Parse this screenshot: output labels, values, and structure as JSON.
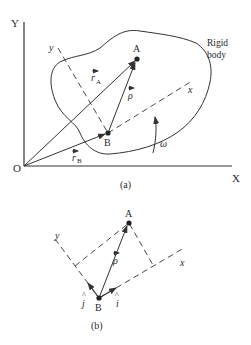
{
  "figure_a": {
    "axis_y_label": "Y",
    "axis_x_label": "X",
    "origin_label": "O",
    "point_a_label": "A",
    "point_b_label": "B",
    "body_label_line1": "Rigid",
    "body_label_line2": "body",
    "local_y_label": "y",
    "local_x_label": "x",
    "r_a_label": "r",
    "r_a_sub": "A",
    "r_b_label": "r",
    "r_b_sub": "B",
    "rho_label": "ρ",
    "omega_label": "ω",
    "caption": "(a)"
  },
  "figure_b": {
    "point_a_label": "A",
    "point_b_label": "B",
    "local_y_label": "y",
    "local_x_label": "x",
    "rho_label": "ρ",
    "i_hat_label": "i",
    "j_hat_label": "j",
    "caption": "(b)"
  },
  "colors": {
    "line": "#333333",
    "text": "#2a2a2a",
    "background": "#ffffff"
  }
}
